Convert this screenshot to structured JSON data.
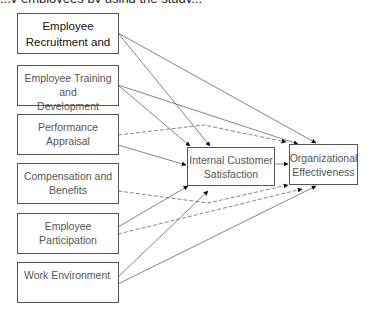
{
  "diagram": {
    "type": "conceptual-model",
    "top_cut_text": "...y employees by using the study...",
    "independent_variables": [
      {
        "id": "recruitment",
        "label": "Employee Recruitment and"
      },
      {
        "id": "training",
        "label": "Employee Training and Development"
      },
      {
        "id": "appraisal",
        "label": "Performance Appraisal"
      },
      {
        "id": "compensation",
        "label": "Compensation and Benefits"
      },
      {
        "id": "participation",
        "label": "Employee Participation"
      },
      {
        "id": "environment",
        "label": "Work Environment"
      }
    ],
    "mediator": {
      "id": "ics",
      "label_line1": "Internal Customer",
      "label_line2": "Satisfaction"
    },
    "outcome": {
      "id": "oe",
      "label_line1": "Organizational",
      "label_line2": "Effectiveness"
    },
    "edges": [
      {
        "from": "recruitment",
        "to": "ics",
        "style": "solid"
      },
      {
        "from": "recruitment",
        "to": "oe",
        "style": "solid"
      },
      {
        "from": "training",
        "to": "ics",
        "style": "solid"
      },
      {
        "from": "training",
        "to": "oe",
        "style": "solid"
      },
      {
        "from": "appraisal",
        "to": "ics",
        "style": "solid"
      },
      {
        "from": "appraisal",
        "to": "oe",
        "style": "dashed"
      },
      {
        "from": "compensation",
        "to": "ics",
        "style": "solid"
      },
      {
        "from": "compensation",
        "to": "oe",
        "style": "dashed"
      },
      {
        "from": "participation",
        "to": "ics",
        "style": "solid"
      },
      {
        "from": "participation",
        "to": "oe",
        "style": "dashed"
      },
      {
        "from": "environment",
        "to": "ics",
        "style": "solid"
      },
      {
        "from": "environment",
        "to": "oe",
        "style": "solid"
      },
      {
        "from": "ics",
        "to": "oe",
        "style": "solid"
      }
    ]
  },
  "labels": {
    "box1_line1": "Employee",
    "box1_line2": "Recruitment and",
    "box2_line1": "Employee Training and",
    "box2_line2": "Development",
    "box3": "Performance Appraisal",
    "box4_line1": "Compensation and",
    "box4_line2": "Benefits",
    "box5": "Employee Participation",
    "box6": "Work Environment",
    "ics_line1": "Internal Customer",
    "ics_line2": "Satisfaction",
    "oe_line1": "Organizational",
    "oe_line2": "Effectiveness"
  }
}
